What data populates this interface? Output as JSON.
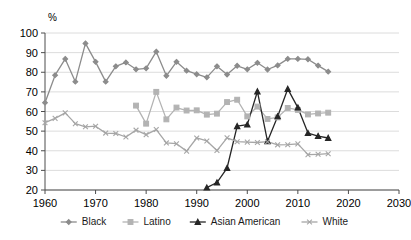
{
  "chart_data": {
    "type": "line",
    "title": "",
    "xlabel": "",
    "ylabel": "%",
    "unit_label": "%",
    "xlim": [
      1960,
      2030
    ],
    "ylim": [
      20,
      100
    ],
    "grid": true,
    "legend_position": "bottom",
    "x_ticks": [
      "1960",
      "1970",
      "1980",
      "1990",
      "2000",
      "2010",
      "2020",
      "2030"
    ],
    "y_ticks": [
      "20",
      "30",
      "40",
      "50",
      "60",
      "70",
      "80",
      "90",
      "100"
    ],
    "series": [
      {
        "name": "Black",
        "color": "#8c8c8c",
        "marker": "diamond",
        "x": [
          1960,
          1962,
          1964,
          1966,
          1968,
          1970,
          1972,
          1974,
          1976,
          1978,
          1980,
          1982,
          1984,
          1986,
          1988,
          1990,
          1992,
          1994,
          1996,
          1998,
          2000,
          2002,
          2004,
          2006,
          2008,
          2010,
          2012,
          2014,
          2016
        ],
        "values": [
          64.5,
          78.5,
          86.8,
          75.2,
          94.7,
          85.3,
          75.2,
          83.0,
          85.0,
          81.5,
          82.0,
          90.5,
          78.2,
          85.3,
          80.8,
          79.0,
          77.4,
          83.0,
          78.8,
          83.3,
          81.5,
          84.8,
          81.4,
          83.5,
          86.8,
          86.8,
          86.6,
          83.4,
          80.3
        ]
      },
      {
        "name": "Latino",
        "color": "#b3b3b3",
        "marker": "square",
        "x": [
          1978,
          1980,
          1982,
          1984,
          1986,
          1988,
          1990,
          1992,
          1994,
          1996,
          1998,
          2000,
          2002,
          2004,
          2006,
          2008,
          2010,
          2012,
          2014,
          2016
        ],
        "values": [
          63.0,
          53.8,
          70.0,
          56.0,
          62.0,
          60.5,
          60.6,
          58.4,
          58.9,
          64.8,
          66.0,
          57.5,
          62.5,
          56.2,
          57.0,
          61.8,
          60.8,
          58.5,
          59.0,
          59.4
        ]
      },
      {
        "name": "Asian American",
        "color": "#262626",
        "marker": "triangle",
        "x": [
          1992,
          1994,
          1996,
          1998,
          2000,
          2002,
          2004,
          2006,
          2008,
          2010,
          2012,
          2014,
          2016
        ],
        "values": [
          21.2,
          23.8,
          31.2,
          52.5,
          53.3,
          70.2,
          44.8,
          57.5,
          71.5,
          62.0,
          49.0,
          47.5,
          46.5
        ]
      },
      {
        "name": "White",
        "color": "#a6a6a6",
        "marker": "cross",
        "x": [
          1960,
          1962,
          1964,
          1966,
          1968,
          1970,
          1972,
          1974,
          1976,
          1978,
          1980,
          1982,
          1984,
          1986,
          1988,
          1990,
          1992,
          1994,
          1996,
          1998,
          2000,
          2002,
          2004,
          2006,
          2008,
          2010,
          2012,
          2014,
          2016
        ],
        "values": [
          54.3,
          56.5,
          59.3,
          53.8,
          52.2,
          52.5,
          49.0,
          48.8,
          47.0,
          50.5,
          48.2,
          50.8,
          44.0,
          43.6,
          39.8,
          46.5,
          45.0,
          40.1,
          46.6,
          44.6,
          44.4,
          44.2,
          44.6,
          43.0,
          43.1,
          43.5,
          38.0,
          38.2,
          38.5
        ]
      }
    ],
    "legend": [
      {
        "label": "Black",
        "color": "#8c8c8c",
        "marker": "diamond"
      },
      {
        "label": "Latino",
        "color": "#b3b3b3",
        "marker": "square"
      },
      {
        "label": "Asian American",
        "color": "#262626",
        "marker": "triangle"
      },
      {
        "label": "White",
        "color": "#a6a6a6",
        "marker": "cross"
      }
    ]
  }
}
